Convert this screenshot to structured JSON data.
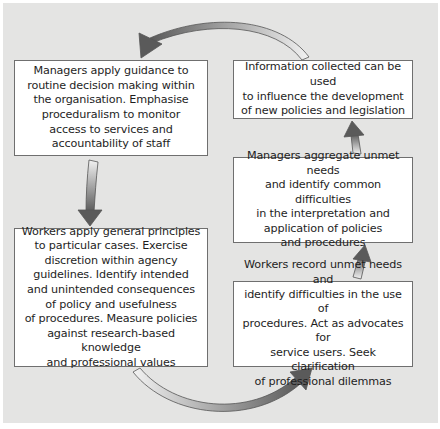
{
  "diagram": {
    "type": "cycle",
    "background_color": "#e4e4e3",
    "box_color": "#ffffff",
    "arrow_gradient": [
      "#f0f0f0",
      "#606060"
    ],
    "boxes": [
      {
        "id": "managers-guidance",
        "position": "top-left",
        "text": "Managers apply guidance to\nroutine decision making within\nthe organisation. Emphasise\nproceduralism to monitor\naccess to services and\naccountability of staff"
      },
      {
        "id": "info-collected",
        "position": "top-right",
        "text": "Information collected can be used\nto influence the development\nof new policies and legislation"
      },
      {
        "id": "managers-aggregate",
        "position": "middle-right",
        "text": "Managers aggregate unmet needs\nand identify common difficulties\nin the interpretation and\napplication of policies\nand procedures"
      },
      {
        "id": "workers-principles",
        "position": "bottom-left",
        "text": "Workers apply general principles\nto particular cases. Exercise\ndiscretion within agency\nguidelines. Identify intended\nand unintended consequences\nof policy and usefulness\nof procedures. Measure policies\nagainst research-based knowledge\nand professional values"
      },
      {
        "id": "workers-record",
        "position": "bottom-right",
        "text": "Workers record unmet needs and\nidentify difficulties in the use of\nprocedures. Act as advocates for\nservice users. Seek clarification\nof professional dilemmas"
      }
    ],
    "arrows": [
      {
        "from": "info-collected",
        "to": "managers-guidance",
        "shape": "curved-top"
      },
      {
        "from": "managers-guidance",
        "to": "workers-principles",
        "shape": "straight-down"
      },
      {
        "from": "workers-principles",
        "to": "workers-record",
        "shape": "curved-bottom"
      },
      {
        "from": "workers-record",
        "to": "managers-aggregate",
        "shape": "straight-up"
      },
      {
        "from": "managers-aggregate",
        "to": "info-collected",
        "shape": "straight-up"
      }
    ]
  }
}
